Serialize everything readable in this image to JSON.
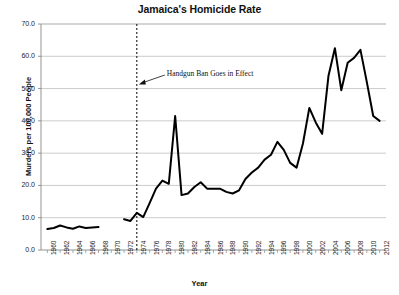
{
  "chart_data": {
    "type": "line",
    "title": "Jamaica's Homicide Rate",
    "xlabel": "Year",
    "ylabel": "Murders per 100,000 People",
    "xlim": [
      1959,
      2013
    ],
    "ylim": [
      0.0,
      70.0
    ],
    "ytick_labels": [
      "0.0",
      "10.0",
      "20.0",
      "30.0",
      "40.0",
      "50.0",
      "60.0",
      "70.0"
    ],
    "ytick_values": [
      0,
      10,
      20,
      30,
      40,
      50,
      60,
      70
    ],
    "xtick_labels": [
      "1960",
      "1962",
      "1964",
      "1966",
      "1968",
      "1970",
      "1972",
      "1974",
      "1976",
      "1978",
      "1980",
      "1982",
      "1984",
      "1986",
      "1988",
      "1990",
      "1992",
      "1994",
      "1996",
      "1998",
      "2000",
      "2002",
      "2004",
      "2006",
      "2008",
      "2010",
      "2012"
    ],
    "xtick_values": [
      1960,
      1962,
      1964,
      1966,
      1968,
      1970,
      1972,
      1974,
      1976,
      1978,
      1980,
      1982,
      1984,
      1986,
      1988,
      1990,
      1992,
      1994,
      1996,
      1998,
      2000,
      2002,
      2004,
      2006,
      2008,
      2010,
      2012
    ],
    "grid": "horizontal",
    "legend": "none",
    "line_color": "#000000",
    "grid_color": "#b5b5b5",
    "axis_color": "#888888",
    "series": [
      {
        "name": "Murders per 100,000 People",
        "segments": [
          {
            "x": [
              1960,
              1961,
              1962,
              1963,
              1964,
              1965,
              1966,
              1967,
              1968
            ],
            "y": [
              6.5,
              6.8,
              7.6,
              7.0,
              6.6,
              7.3,
              6.8,
              7.0,
              7.1
            ]
          },
          {
            "x": [
              1972,
              1973,
              1974,
              1975,
              1976,
              1977,
              1978,
              1979,
              1980,
              1981,
              1982,
              1983,
              1984,
              1985,
              1986,
              1987,
              1988,
              1989,
              1990,
              1991,
              1992,
              1993,
              1994,
              1995,
              1996,
              1997,
              1998,
              1999,
              2000,
              2001,
              2002,
              2003,
              2004,
              2005,
              2006,
              2007,
              2008,
              2009,
              2010,
              2011,
              2012
            ],
            "y": [
              9.5,
              9.0,
              11.5,
              10.2,
              14.5,
              19.0,
              21.5,
              20.5,
              41.5,
              17.0,
              17.5,
              19.5,
              21.0,
              19.0,
              19.0,
              19.0,
              18.0,
              17.5,
              18.5,
              22.0,
              24.0,
              25.5,
              28.0,
              29.5,
              33.5,
              31.0,
              27.0,
              25.5,
              33.0,
              44.0,
              39.5,
              36.0,
              54.0,
              62.5,
              49.5,
              58.0,
              59.5,
              62.0,
              52.0,
              41.5,
              40.0
            ]
          }
        ]
      }
    ],
    "annotations": [
      {
        "name": "handgun-ban",
        "text": "Handgun Ban Goes in Effect",
        "x": 1974,
        "line_style": "dashed",
        "line_color": "#000000",
        "arrow": "left"
      }
    ]
  }
}
